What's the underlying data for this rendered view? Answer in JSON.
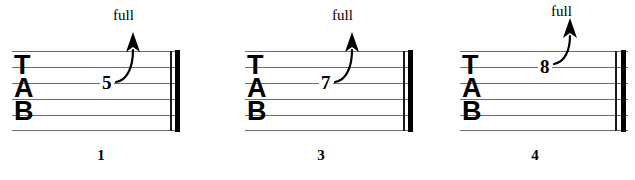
{
  "document": {
    "type": "guitar-tablature",
    "clef_letters": [
      "T",
      "A",
      "B"
    ],
    "background_color": "#ffffff",
    "line_color": "#6d6d6d",
    "ink_color": "#000000"
  },
  "measures": [
    {
      "number": "1",
      "fret": "5",
      "bend_label": "full",
      "string_index": 2,
      "left": 12,
      "staff_width": 168,
      "fret_x": 88,
      "fret_y": 73,
      "bend_x": 110,
      "bend_y": 22,
      "label_x": 104,
      "label_y": 8,
      "number_x": 96
    },
    {
      "number": "3",
      "fret": "7",
      "bend_label": "full",
      "string_index": 2,
      "left": 245,
      "staff_width": 168,
      "fret_x": 74,
      "fret_y": 73,
      "bend_x": 96,
      "bend_y": 22,
      "label_x": 90,
      "label_y": 8,
      "number_x": 60
    },
    {
      "number": "4",
      "fret": "8",
      "bend_label": "full",
      "string_index": 1,
      "left": 460,
      "staff_width": 168,
      "fret_x": 78,
      "fret_y": 57,
      "bend_x": 100,
      "bend_y": 12,
      "label_x": 94,
      "label_y": 4,
      "number_x": 60
    }
  ]
}
